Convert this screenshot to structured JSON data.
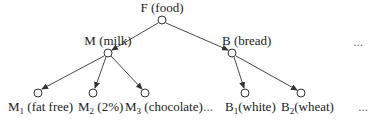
{
  "diagram": {
    "type": "tree",
    "nodes": {
      "root": {
        "id": "F",
        "label": "F (food)",
        "x": 162,
        "y": 20
      },
      "milk": {
        "id": "M",
        "label": "M (milk)",
        "x": 108,
        "y": 53
      },
      "bread": {
        "id": "B",
        "label": "B (bread)",
        "x": 232,
        "y": 53
      },
      "m1": {
        "id": "M1",
        "base": "M",
        "sub": "1",
        "desc": " (fat free)",
        "x": 38,
        "y": 93
      },
      "m2": {
        "id": "M2",
        "base": "M",
        "sub": "2",
        "desc": " (2%)",
        "x": 93,
        "y": 93
      },
      "m3": {
        "id": "M3",
        "base": "M",
        "sub": "3",
        "desc": " (chocolate)",
        "x": 145,
        "y": 93
      },
      "b1": {
        "id": "B1",
        "base": "B",
        "sub": "1",
        "desc": "(white)",
        "x": 245,
        "y": 93
      },
      "b2": {
        "id": "B2",
        "base": "B",
        "sub": "2",
        "desc": "(wheat)",
        "x": 301,
        "y": 93
      }
    },
    "edges": [
      {
        "from": "F",
        "to": "M"
      },
      {
        "from": "F",
        "to": "B"
      },
      {
        "from": "M",
        "to": "M1"
      },
      {
        "from": "M",
        "to": "M2"
      },
      {
        "from": "M",
        "to": "M3"
      },
      {
        "from": "B",
        "to": "B1"
      },
      {
        "from": "B",
        "to": "B2"
      }
    ],
    "ellipses": {
      "level1": "...",
      "level2_middle": "...",
      "level2_end": "..."
    }
  }
}
